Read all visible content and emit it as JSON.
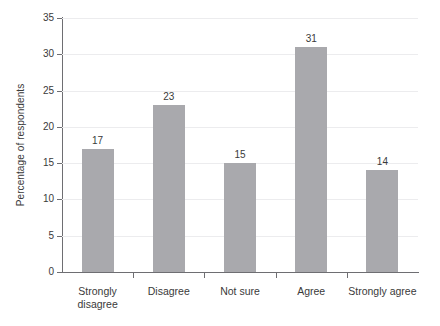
{
  "chart_data": {
    "type": "bar",
    "title": "",
    "subtitle": "",
    "xlabel": "",
    "ylabel": "Percentage of respondents",
    "categories": [
      "Strongly\ndisagree",
      "Disagree",
      "Not sure",
      "Agree",
      "Strongly agree"
    ],
    "values": [
      17,
      23,
      15,
      31,
      14
    ],
    "data_labels": [
      "17",
      "23",
      "15",
      "31",
      "14"
    ],
    "ylim": [
      0,
      35
    ],
    "ytick_labels": [
      "0",
      "5",
      "10",
      "15",
      "20",
      "25",
      "30",
      "35"
    ],
    "ytick_values": [
      0,
      5,
      10,
      15,
      20,
      25,
      30,
      35
    ],
    "grid": "horizontal",
    "legend": "none",
    "colors": {
      "bar": "#a9a9ad",
      "gridline": "#ececee",
      "axis": "#6e6e72",
      "text": "#3a3a3a",
      "background": "#ffffff"
    }
  }
}
